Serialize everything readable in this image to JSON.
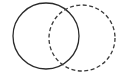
{
  "diagram": {
    "type": "venn",
    "background": "#ffffff",
    "circles": [
      {
        "name": "solid-circle",
        "cx": 46,
        "cy": 36,
        "r": 33,
        "stroke": "#2a2a2a",
        "dashed": false
      },
      {
        "name": "dashed-circle",
        "cx": 82,
        "cy": 38,
        "r": 33,
        "stroke": "#3a3a3a",
        "dashed": true
      }
    ]
  }
}
